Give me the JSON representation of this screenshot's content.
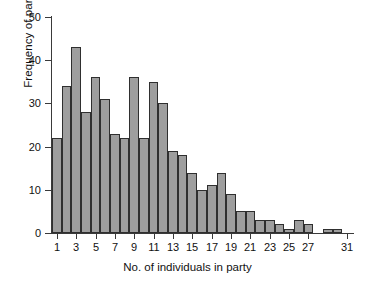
{
  "chart_data": {
    "type": "bar",
    "title": "",
    "xlabel": "No. of individuals in party",
    "ylabel": "Frequency of party sizes",
    "xlim": [
      0.5,
      31.5
    ],
    "ylim": [
      0,
      50
    ],
    "ytick_values": [
      0,
      10,
      20,
      30,
      40,
      50
    ],
    "ytick_labels": [
      "0",
      "10",
      "20",
      "30",
      "40",
      "50"
    ],
    "xtick_values": [
      1,
      3,
      5,
      7,
      9,
      11,
      13,
      15,
      17,
      19,
      21,
      23,
      25,
      27,
      31
    ],
    "xtick_labels": [
      "1",
      "3",
      "5",
      "7",
      "9",
      "11",
      "13",
      "15",
      "17",
      "19",
      "21",
      "23",
      "25",
      "27",
      "31"
    ],
    "grid": false,
    "legend": null,
    "bar_color": "#9e9e9e",
    "bar_edge_color": "#2f2f2f",
    "axis_color": "#3a3a3a",
    "categories": [
      1,
      2,
      3,
      4,
      5,
      6,
      7,
      8,
      9,
      10,
      11,
      12,
      13,
      14,
      15,
      16,
      17,
      18,
      19,
      20,
      21,
      22,
      23,
      24,
      25,
      26,
      27,
      28,
      29,
      30,
      31
    ],
    "values": [
      22,
      34,
      43,
      28,
      36,
      31,
      23,
      22,
      36,
      22,
      35,
      30,
      19,
      18,
      14,
      10,
      11,
      14,
      9,
      5,
      5,
      3,
      3,
      2,
      1,
      3,
      2,
      0,
      1,
      1,
      0
    ]
  }
}
